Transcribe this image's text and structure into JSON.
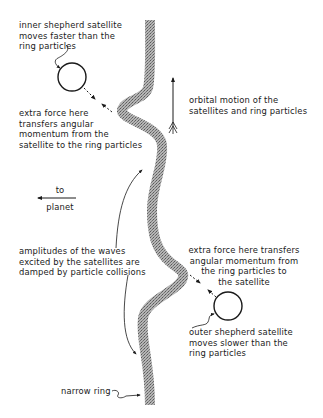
{
  "diagram": {
    "type": "shepherd-satellite ring confinement",
    "labels": {
      "inner_satellite": "inner shepherd satellite\nmoves faster than the\nring particles",
      "inner_force": "extra force here\ntransfers angular\nmomentum from the\nsatellite to the ring particles",
      "orbital_motion": "orbital motion of the\nsatellites and ring particles",
      "to_planet_top": "to",
      "to_planet_bottom": "planet",
      "amplitudes": "amplitudes of the waves\nexcited by the satellites are\ndamped by particle collisions",
      "outer_force": "extra force here transfers\nangular momentum from\nthe ring particles to\nthe satellite",
      "outer_satellite": "outer shepherd satellite\nmoves slower than the\nring particles",
      "narrow_ring": "narrow ring"
    },
    "elements": {
      "inner_satellite": {
        "shape": "circle",
        "position": "upper-left of ring"
      },
      "outer_satellite": {
        "shape": "circle",
        "position": "lower-right of ring"
      },
      "ring": {
        "shape": "wavy stippled band",
        "color": "#8a8a8a"
      },
      "orbital_arrow": {
        "direction": "up"
      },
      "planet_arrow": {
        "direction": "left"
      }
    },
    "colors": {
      "ink": "#1a1a1a",
      "ring_fill": "#9a9a9a"
    }
  }
}
